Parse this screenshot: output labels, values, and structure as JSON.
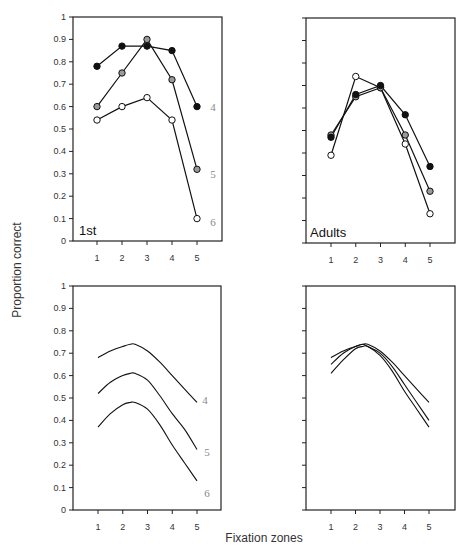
{
  "chart_data": [
    {
      "type": "line",
      "panel": "top-left",
      "title": "1st",
      "xlabel": "Fixation zones",
      "ylabel": "Proportion correct",
      "x": [
        1,
        2,
        3,
        4,
        5
      ],
      "ylim": [
        0,
        1
      ],
      "yticks": [
        "0",
        "0.1",
        "0.2",
        "0.3",
        "0.4",
        "0.5",
        "0.6",
        "0.7",
        "0.8",
        "0.9",
        "1"
      ],
      "xticks": [
        "1",
        "2",
        "3",
        "4",
        "5"
      ],
      "grid": false,
      "series": [
        {
          "name": "4",
          "marker": "filled",
          "values": [
            0.78,
            0.87,
            0.87,
            0.85,
            0.6
          ]
        },
        {
          "name": "5",
          "marker": "gray",
          "values": [
            0.6,
            0.75,
            0.9,
            0.72,
            0.32
          ]
        },
        {
          "name": "6",
          "marker": "open",
          "values": [
            0.54,
            0.6,
            0.64,
            0.54,
            0.1
          ]
        }
      ]
    },
    {
      "type": "line",
      "panel": "top-right",
      "title": "Adults",
      "x": [
        1,
        2,
        3,
        4,
        5
      ],
      "ylim": [
        0,
        1
      ],
      "xticks": [
        "1",
        "2",
        "3",
        "4",
        "5"
      ],
      "grid": false,
      "series": [
        {
          "name": "4",
          "marker": "filled",
          "values": [
            0.47,
            0.66,
            0.7,
            0.57,
            0.34
          ]
        },
        {
          "name": "5",
          "marker": "gray",
          "values": [
            0.48,
            0.65,
            0.69,
            0.48,
            0.23
          ]
        },
        {
          "name": "6",
          "marker": "open",
          "values": [
            0.39,
            0.74,
            0.69,
            0.44,
            0.13
          ]
        }
      ]
    },
    {
      "type": "line",
      "panel": "bottom-left",
      "title": "",
      "x": [
        1,
        1.5,
        2,
        2.3,
        2.5,
        3,
        3.5,
        4,
        4.5,
        5
      ],
      "ylim": [
        0,
        1
      ],
      "yticks": [
        "0",
        "0.1",
        "0.2",
        "0.3",
        "0.4",
        "0.5",
        "0.6",
        "0.7",
        "0.8",
        "0.9",
        "1"
      ],
      "xticks": [
        "1",
        "2",
        "3",
        "4",
        "5"
      ],
      "grid": false,
      "series": [
        {
          "name": "4",
          "values": [
            0.68,
            0.71,
            0.73,
            0.74,
            0.74,
            0.71,
            0.66,
            0.6,
            0.54,
            0.48
          ]
        },
        {
          "name": "5",
          "values": [
            0.52,
            0.57,
            0.6,
            0.61,
            0.61,
            0.58,
            0.51,
            0.43,
            0.36,
            0.27
          ]
        },
        {
          "name": "6",
          "values": [
            0.37,
            0.43,
            0.47,
            0.48,
            0.48,
            0.45,
            0.38,
            0.29,
            0.21,
            0.13
          ]
        }
      ]
    },
    {
      "type": "line",
      "panel": "bottom-right",
      "title": "",
      "x": [
        1,
        1.5,
        2,
        2.3,
        2.5,
        3,
        3.5,
        4,
        4.5,
        5
      ],
      "ylim": [
        0,
        1
      ],
      "xticks": [
        "1",
        "2",
        "3",
        "4",
        "5"
      ],
      "grid": false,
      "series": [
        {
          "name": "4",
          "values": [
            0.68,
            0.71,
            0.73,
            0.74,
            0.74,
            0.71,
            0.66,
            0.6,
            0.54,
            0.48
          ]
        },
        {
          "name": "5",
          "values": [
            0.65,
            0.7,
            0.73,
            0.74,
            0.73,
            0.7,
            0.64,
            0.56,
            0.48,
            0.4
          ]
        },
        {
          "name": "6",
          "values": [
            0.61,
            0.67,
            0.72,
            0.73,
            0.73,
            0.69,
            0.62,
            0.53,
            0.45,
            0.37
          ]
        }
      ]
    }
  ],
  "labels": {
    "ylabel": "Proportion correct",
    "xlabel": "Fixation zones",
    "panel_top_left": "1st",
    "panel_top_right": "Adults",
    "series_4": "4",
    "series_5": "5",
    "series_6": "6"
  },
  "colors": {
    "line": "#111111",
    "filled_marker": "#111111",
    "gray_marker": "#9a9a9a",
    "open_marker": "#ffffff",
    "series_label": "#888888"
  }
}
